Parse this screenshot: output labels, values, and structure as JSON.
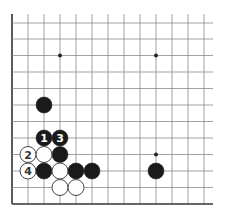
{
  "board": {
    "grid": {
      "origin_x": 12,
      "col_spacing": 16,
      "cols": 13,
      "right_extent": 213,
      "top_extent": 14,
      "row_ys": [
        23,
        39,
        55.5,
        72,
        88.5,
        105,
        121.5,
        138,
        154.5,
        171,
        187.5,
        204
      ],
      "edges": [
        "left",
        "bottom"
      ],
      "line_color": "#8a8a8a",
      "edge_color": "#333333"
    },
    "star_points": [
      {
        "col": 3,
        "row": 2
      },
      {
        "col": 9,
        "row": 2
      },
      {
        "col": 9,
        "row": 8
      }
    ],
    "stone_radius": 8,
    "stones": [
      {
        "color": "black",
        "col": 2,
        "row": 5,
        "label": ""
      },
      {
        "color": "black",
        "col": 2,
        "row": 7,
        "label": "1"
      },
      {
        "color": "black",
        "col": 3,
        "row": 7,
        "label": "3"
      },
      {
        "color": "white",
        "col": 1,
        "row": 8,
        "label": "2"
      },
      {
        "color": "white",
        "col": 2,
        "row": 8,
        "label": ""
      },
      {
        "color": "black",
        "col": 3,
        "row": 8,
        "label": ""
      },
      {
        "color": "white",
        "col": 1,
        "row": 9,
        "label": "4"
      },
      {
        "color": "black",
        "col": 2,
        "row": 9,
        "label": ""
      },
      {
        "color": "white",
        "col": 3,
        "row": 9,
        "label": ""
      },
      {
        "color": "black",
        "col": 4,
        "row": 9,
        "label": ""
      },
      {
        "color": "black",
        "col": 5,
        "row": 9,
        "label": ""
      },
      {
        "color": "black",
        "col": 9,
        "row": 9,
        "label": ""
      },
      {
        "color": "white",
        "col": 3,
        "row": 10,
        "label": ""
      },
      {
        "color": "white",
        "col": 4,
        "row": 10,
        "label": ""
      }
    ],
    "colors": {
      "black_stone": "#1a1a1a",
      "white_stone": "#ffffff",
      "white_stone_border": "#333333",
      "black_label": "#ffffff",
      "white_label": "#333333"
    }
  }
}
